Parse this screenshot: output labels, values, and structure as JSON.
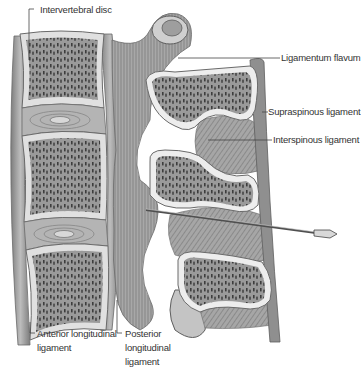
{
  "figure": {
    "colors": {
      "background": "#ffffff",
      "bone_cortex": "#e4e4e4",
      "bone_outline": "#6a6a6a",
      "cancellous_fill": "#8c8c8c",
      "trabecula_dots": "#3d3d3d",
      "ligament": "#9a9a9a",
      "ligament_dark": "#6e6e6e",
      "disc": "#b8b8b8",
      "leader_line": "#444444",
      "label_text": "#333333",
      "needle": "#555555"
    }
  },
  "labels": {
    "intervertebral_disc": "Intervertebral disc",
    "ligamentum_flavum": "Ligamentum flavum",
    "supraspinous_ligament": "Supraspinous ligament",
    "interspinous_ligament": "Interspinous ligament",
    "anterior_longitudinal_ligament": "Anterior longitudinal ligament",
    "posterior_longitudinal_ligament": "Posterior longitudinal ligament"
  },
  "structures": {
    "vertebral_bodies": 3,
    "intervertebral_discs": 2,
    "spinous_processes": 3,
    "instrument": "Spinal needle"
  }
}
